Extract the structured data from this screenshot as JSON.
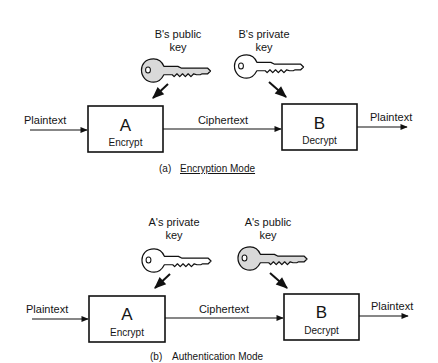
{
  "panels": [
    {
      "id": "a",
      "caption_prefix": "(a)",
      "caption": "Encryption Mode",
      "caption_underlined": true,
      "input_label": "Plaintext",
      "channel_label": "Ciphertext",
      "output_label": "Plaintext",
      "box_a": {
        "letter": "A",
        "action": "Encrypt"
      },
      "box_b": {
        "letter": "B",
        "action": "Decrypt"
      },
      "key_left": {
        "line1": "B's public",
        "line2": "key",
        "icon": "key-icon",
        "fill": "#d9d9d9"
      },
      "key_right": {
        "line1": "B's private",
        "line2": "key",
        "icon": "key-icon",
        "fill": "#ffffff"
      }
    },
    {
      "id": "b",
      "caption_prefix": "(b)",
      "caption": "Authentication Mode",
      "caption_underlined": false,
      "input_label": "Plaintext",
      "channel_label": "Ciphertext",
      "output_label": "Plaintext",
      "box_a": {
        "letter": "A",
        "action": "Encrypt"
      },
      "box_b": {
        "letter": "B",
        "action": "Decrypt"
      },
      "key_left": {
        "line1": "A's private",
        "line2": "key",
        "icon": "key-icon",
        "fill": "#ffffff"
      },
      "key_right": {
        "line1": "A's public",
        "line2": "key",
        "icon": "key-icon",
        "fill": "#d9d9d9"
      }
    }
  ]
}
